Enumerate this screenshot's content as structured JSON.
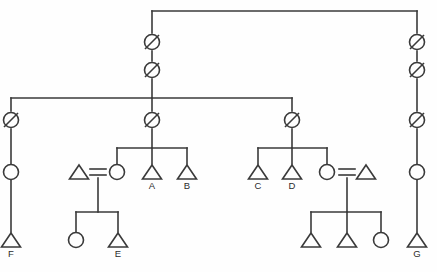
{
  "diagram": {
    "type": "kinship-chart",
    "background_color": "#fefefe",
    "line_color": "#3a3a3a",
    "width": 437,
    "height": 272,
    "legend": {
      "triangle": "male",
      "circle": "female",
      "slashed_circle": "deceased ancestor",
      "double_line": "marriage"
    },
    "labels": {
      "A": "A",
      "B": "B",
      "C": "C",
      "D": "D",
      "E": "E",
      "F": "F",
      "G": "G"
    },
    "nodes": [
      {
        "id": "apical1",
        "shape": "slashed-circle",
        "x": 152,
        "y": 42,
        "label": ""
      },
      {
        "id": "apical2",
        "shape": "slashed-circle",
        "x": 152,
        "y": 70,
        "label": ""
      },
      {
        "id": "mid-c",
        "shape": "slashed-circle",
        "x": 152,
        "y": 120,
        "label": ""
      },
      {
        "id": "mid-l",
        "shape": "slashed-circle",
        "x": 11,
        "y": 120,
        "label": ""
      },
      {
        "id": "mid-r",
        "shape": "slashed-circle",
        "x": 292,
        "y": 120,
        "label": ""
      },
      {
        "id": "r-anc1",
        "shape": "slashed-circle",
        "x": 417,
        "y": 42,
        "label": ""
      },
      {
        "id": "r-anc2",
        "shape": "slashed-circle",
        "x": 417,
        "y": 70,
        "label": ""
      },
      {
        "id": "r-anc3",
        "shape": "slashed-circle",
        "x": 417,
        "y": 120,
        "label": ""
      },
      {
        "id": "l-fem",
        "shape": "circle",
        "x": 11,
        "y": 172,
        "label": ""
      },
      {
        "id": "r-fem",
        "shape": "circle",
        "x": 417,
        "y": 172,
        "label": ""
      },
      {
        "id": "F",
        "shape": "triangle",
        "x": 11,
        "y": 240,
        "label": "F"
      },
      {
        "id": "G",
        "shape": "triangle",
        "x": 417,
        "y": 240,
        "label": "G"
      },
      {
        "id": "sp-l",
        "shape": "triangle",
        "x": 79,
        "y": 172,
        "label": ""
      },
      {
        "id": "c1-fem",
        "shape": "circle",
        "x": 117,
        "y": 172,
        "label": ""
      },
      {
        "id": "A",
        "shape": "triangle",
        "x": 152,
        "y": 172,
        "label": "A"
      },
      {
        "id": "B",
        "shape": "triangle",
        "x": 187,
        "y": 172,
        "label": "B"
      },
      {
        "id": "C",
        "shape": "triangle",
        "x": 258,
        "y": 172,
        "label": "C"
      },
      {
        "id": "D",
        "shape": "triangle",
        "x": 292,
        "y": 172,
        "label": "D"
      },
      {
        "id": "c2-fem",
        "shape": "circle",
        "x": 327,
        "y": 172,
        "label": ""
      },
      {
        "id": "sp-r",
        "shape": "triangle",
        "x": 366,
        "y": 172,
        "label": ""
      },
      {
        "id": "g1-fem",
        "shape": "circle",
        "x": 76,
        "y": 240,
        "label": ""
      },
      {
        "id": "E",
        "shape": "triangle",
        "x": 118,
        "y": 240,
        "label": "E"
      },
      {
        "id": "g2-m1",
        "shape": "triangle",
        "x": 311,
        "y": 240,
        "label": ""
      },
      {
        "id": "g2-m2",
        "shape": "triangle",
        "x": 347,
        "y": 240,
        "label": ""
      },
      {
        "id": "g2-fem",
        "shape": "circle",
        "x": 381,
        "y": 240,
        "label": ""
      }
    ],
    "marriages": [
      {
        "left": "sp-l",
        "right": "c1-fem",
        "y": 172
      },
      {
        "left": "c2-fem",
        "right": "sp-r",
        "y": 172
      }
    ],
    "sibling_groups": [
      {
        "bar_y": 98,
        "from_x": 11,
        "to_x": 292,
        "descent_x": 152
      },
      {
        "bar_y": 148,
        "from_x": 117,
        "to_x": 187,
        "descent_x": 152
      },
      {
        "bar_y": 148,
        "from_x": 258,
        "to_x": 327,
        "descent_x": 292
      },
      {
        "bar_y": 212,
        "from_x": 76,
        "to_x": 118,
        "descent_x": 98
      },
      {
        "bar_y": 212,
        "from_x": 311,
        "to_x": 381,
        "descent_x": 347
      }
    ]
  }
}
